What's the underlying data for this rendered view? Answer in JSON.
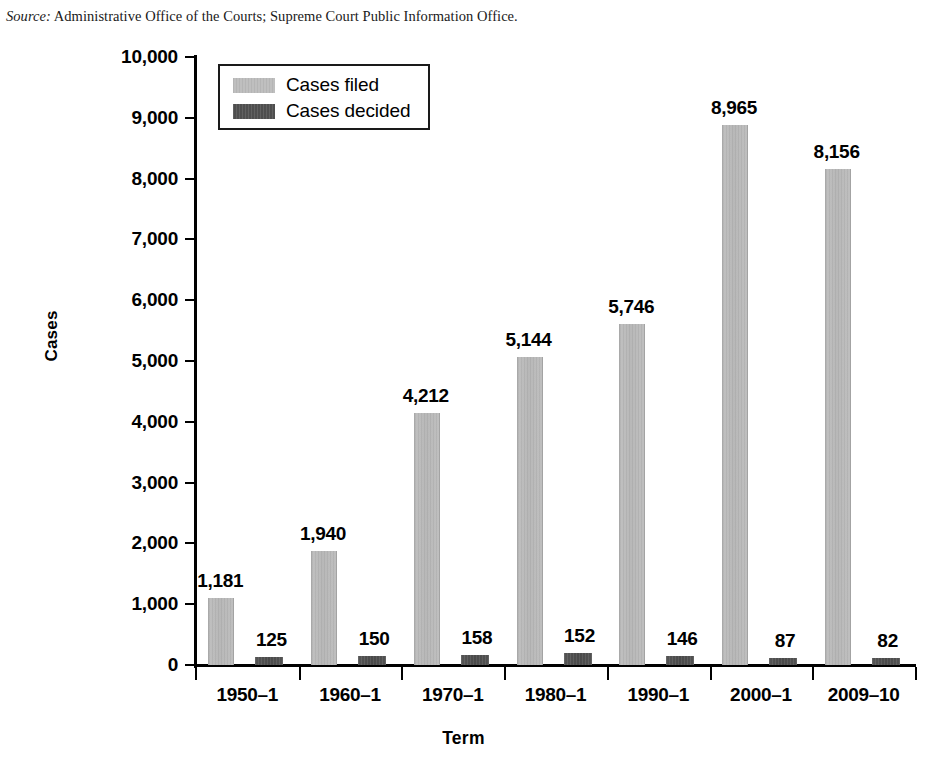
{
  "scan_artifact": {
    "text": " "
  },
  "source_note": {
    "label": "Source:",
    "text": " Administrative Office of the Courts; Supreme Court Public Information Office."
  },
  "legend": {
    "items": [
      {
        "key": "filed",
        "label": "Cases filed",
        "color": "#bcbcbc"
      },
      {
        "key": "decided",
        "label": "Cases decided",
        "color": "#555555"
      }
    ]
  },
  "axes": {
    "y_title": "Cases",
    "x_title": "Term",
    "y_ticks": [
      "0",
      "1,000",
      "2,000",
      "3,000",
      "4,000",
      "5,000",
      "6,000",
      "7,000",
      "8,000",
      "9,000",
      "10,000"
    ]
  },
  "chart_data": {
    "type": "bar",
    "title": "",
    "subtitle": "",
    "xlabel": "Term",
    "ylabel": "Cases",
    "ylim": [
      0,
      10000
    ],
    "ytick_step": 1000,
    "grid": false,
    "legend_position": "top-left-inside",
    "categories": [
      "1950–1",
      "1960–1",
      "1970–1",
      "1980–1",
      "1990–1",
      "2000–1",
      "2009–10"
    ],
    "series": [
      {
        "name": "Cases filed",
        "color": "#bcbcbc",
        "values": [
          1181,
          1940,
          4212,
          5144,
          5746,
          8965,
          8156
        ],
        "labels": [
          "1,181",
          "1,940",
          "4,212",
          "5,144",
          "5,746",
          "8,965",
          "8,156"
        ],
        "drawn_heights": [
          1100,
          1870,
          4140,
          5060,
          5615,
          8875,
          8155
        ]
      },
      {
        "name": "Cases decided",
        "color": "#555555",
        "values": [
          125,
          150,
          158,
          152,
          146,
          87,
          82
        ],
        "labels": [
          "125",
          "150",
          "158",
          "152",
          "146",
          "87",
          "82"
        ],
        "drawn_heights": [
          125,
          150,
          158,
          190,
          150,
          95,
          80
        ]
      }
    ]
  }
}
